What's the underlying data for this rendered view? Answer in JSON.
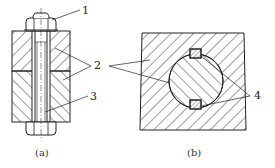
{
  "figure": {
    "part_a": {
      "caption": "(a)",
      "labels": [
        "1",
        "2",
        "3"
      ]
    },
    "part_b": {
      "caption": "(b)",
      "labels": [
        "4"
      ]
    }
  },
  "colors": {
    "stroke": "#222222",
    "background": "#ffffff"
  }
}
